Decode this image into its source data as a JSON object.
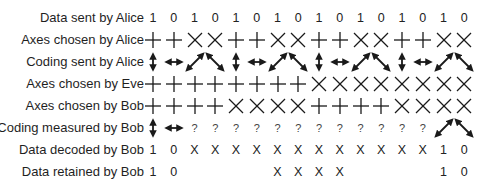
{
  "diagram": {
    "rows": [
      {
        "label": "Data sent by Alice",
        "kind": "text",
        "cells": [
          "1",
          "0",
          "1",
          "0",
          "1",
          "0",
          "1",
          "0",
          "1",
          "0",
          "1",
          "0",
          "1",
          "0",
          "1",
          "0"
        ]
      },
      {
        "label": "Axes chosen by Alice",
        "kind": "axes",
        "cells": [
          "plus-icon",
          "plus-icon",
          "cross-icon",
          "cross-icon",
          "plus-icon",
          "plus-icon",
          "cross-icon",
          "cross-icon",
          "plus-icon",
          "plus-icon",
          "cross-icon",
          "cross-icon",
          "plus-icon",
          "plus-icon",
          "cross-icon",
          "cross-icon"
        ]
      },
      {
        "label": "Coding sent by Alice",
        "kind": "arrows",
        "cells": [
          "arrow-vertical-icon",
          "arrow-horizontal-icon",
          "arrow-diagonal-up-icon",
          "arrow-diagonal-down-icon",
          "arrow-vertical-icon",
          "arrow-horizontal-icon",
          "arrow-diagonal-up-icon",
          "arrow-diagonal-down-icon",
          "arrow-vertical-icon",
          "arrow-horizontal-icon",
          "arrow-diagonal-up-icon",
          "arrow-diagonal-down-icon",
          "arrow-vertical-icon",
          "arrow-horizontal-icon",
          "arrow-diagonal-up-icon",
          "arrow-diagonal-down-icon"
        ]
      },
      {
        "label": "Axes chosen by Eve",
        "kind": "axes",
        "cells": [
          "plus-icon",
          "plus-icon",
          "plus-icon",
          "plus-icon",
          "plus-icon",
          "plus-icon",
          "plus-icon",
          "plus-icon",
          "cross-icon",
          "cross-icon",
          "cross-icon",
          "cross-icon",
          "cross-icon",
          "cross-icon",
          "cross-icon",
          "cross-icon"
        ]
      },
      {
        "label": "Axes chosen by Bob",
        "kind": "axes",
        "cells": [
          "plus-icon",
          "plus-icon",
          "plus-icon",
          "plus-icon",
          "cross-icon",
          "cross-icon",
          "cross-icon",
          "cross-icon",
          "plus-icon",
          "plus-icon",
          "plus-icon",
          "plus-icon",
          "cross-icon",
          "cross-icon",
          "cross-icon",
          "cross-icon"
        ]
      },
      {
        "label": "Coding measured by Bob",
        "kind": "mixed",
        "cells": [
          "arrow-vertical-icon",
          "arrow-horizontal-icon",
          "?",
          "?",
          "?",
          "?",
          "?",
          "?",
          "?",
          "?",
          "?",
          "?",
          "?",
          "?",
          "arrow-diagonal-up-icon",
          "arrow-diagonal-down-icon"
        ]
      },
      {
        "label": "Data decoded by Bob",
        "kind": "text",
        "cells": [
          "1",
          "0",
          "X",
          "X",
          "X",
          "X",
          "X",
          "X",
          "X",
          "X",
          "X",
          "X",
          "X",
          "X",
          "1",
          "0"
        ]
      },
      {
        "label": "Data retained by Bob",
        "kind": "text",
        "cells": [
          "1",
          "0",
          "",
          "",
          "",
          "",
          "X",
          "X",
          "X",
          "X",
          "",
          "",
          "",
          "",
          "1",
          "0"
        ]
      }
    ]
  }
}
